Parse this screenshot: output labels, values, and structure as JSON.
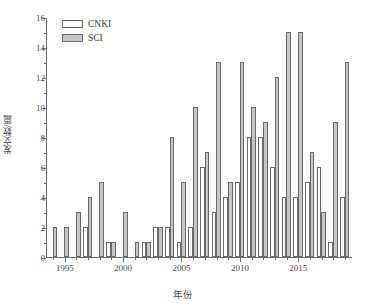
{
  "chart_data": {
    "type": "bar",
    "title": "",
    "xlabel": "年份",
    "ylabel": "发文数/篇",
    "ylim": [
      0,
      16
    ],
    "ytick_values": [
      0,
      2,
      4,
      6,
      8,
      10,
      12,
      14,
      16
    ],
    "ytick_labels": [
      "0",
      "2",
      "4",
      "6",
      "8",
      "10",
      "12",
      "14",
      "16"
    ],
    "yminor_values": [
      1,
      3,
      5,
      7,
      9,
      11,
      13,
      15
    ],
    "xtick_labels": [
      "1995",
      "2000",
      "2005",
      "2010",
      "2015"
    ],
    "xtick_values": [
      1995,
      2000,
      2005,
      2010,
      2015
    ],
    "xlim": [
      1993.4,
      2019.6
    ],
    "grid": false,
    "legend_position": "top-left",
    "categories": [
      1994,
      1995,
      1996,
      1997,
      1998,
      1999,
      2000,
      2001,
      2002,
      2003,
      2004,
      2005,
      2006,
      2007,
      2008,
      2009,
      2010,
      2011,
      2012,
      2013,
      2014,
      2015,
      2016,
      2017,
      2018,
      2019
    ],
    "series": [
      {
        "name": "CNKI",
        "color": "#ffffff",
        "values": [
          0,
          0,
          0,
          2,
          0,
          1,
          0,
          0,
          1,
          2,
          2,
          1,
          2,
          6,
          3,
          4,
          5,
          8,
          8,
          6,
          4,
          4,
          5,
          6,
          1,
          4
        ]
      },
      {
        "name": "SCI",
        "color": "#c6c6c6",
        "values": [
          2,
          2,
          3,
          4,
          5,
          1,
          3,
          1,
          1,
          2,
          8,
          5,
          10,
          7,
          13,
          5,
          13,
          10,
          9,
          12,
          15,
          15,
          7,
          3,
          9,
          13
        ]
      }
    ]
  },
  "legend": {
    "items": [
      {
        "label": "CNKI",
        "swatch": "cnki"
      },
      {
        "label": "SCI",
        "swatch": "sci"
      }
    ]
  }
}
